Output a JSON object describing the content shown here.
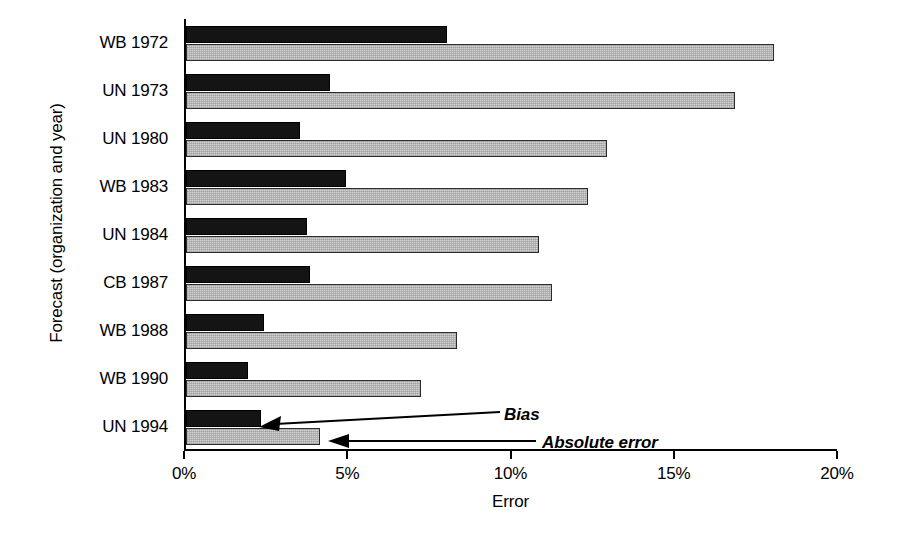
{
  "chart_data": {
    "type": "bar",
    "orientation": "horizontal",
    "title": "",
    "xlabel": "Error",
    "ylabel": "Forecast (organization and year)",
    "categories": [
      "WB 1972",
      "UN 1973",
      "UN 1980",
      "WB 1983",
      "UN 1984",
      "CB 1987",
      "WB 1988",
      "WB 1990",
      "UN 1994"
    ],
    "series": [
      {
        "name": "Bias",
        "values": [
          8.0,
          4.4,
          3.5,
          4.9,
          3.7,
          3.8,
          2.4,
          1.9,
          2.3
        ],
        "color": "#141414"
      },
      {
        "name": "Absolute error",
        "values": [
          18.0,
          16.8,
          12.9,
          12.3,
          10.8,
          11.2,
          8.3,
          7.2,
          4.1
        ],
        "color": "#d3d3d3"
      }
    ],
    "xlim": [
      0,
      20
    ],
    "xticks": [
      0,
      5,
      10,
      15,
      20
    ],
    "xticklabels": [
      "0%",
      "5%",
      "10%",
      "15%",
      "20%"
    ],
    "grid": false,
    "legend_position": "inline-annotations",
    "annotations": [
      {
        "label": "Bias",
        "points_to": "UN 1994 bias bar"
      },
      {
        "label": "Absolute error",
        "points_to": "UN 1994 absolute error bar"
      }
    ]
  },
  "axis": {
    "xlabel": "Error",
    "ylabel": "Forecast (organization and year)",
    "xticklabels": [
      "0%",
      "5%",
      "10%",
      "15%",
      "20%"
    ]
  },
  "annotations": {
    "bias": "Bias",
    "absolute_error": "Absolute error"
  }
}
